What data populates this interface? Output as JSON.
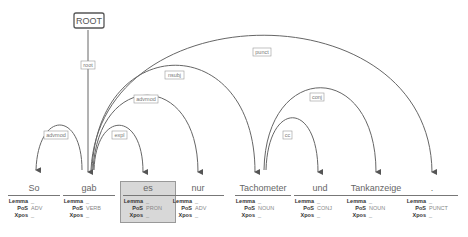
{
  "root_label": "ROOT",
  "tokens": [
    {
      "form": "So",
      "lemma": "_",
      "pos": "ADV",
      "xpos": "_"
    },
    {
      "form": "gab",
      "lemma": "_",
      "pos": "VERB",
      "xpos": "_"
    },
    {
      "form": "es",
      "lemma": "_",
      "pos": "PRON",
      "xpos": "_"
    },
    {
      "form": "nur",
      "lemma": "_",
      "pos": "ADV",
      "xpos": "_"
    },
    {
      "form": "Tachometer",
      "lemma": "_",
      "pos": "NOUN",
      "xpos": "_"
    },
    {
      "form": "und",
      "lemma": "_",
      "pos": "CONJ",
      "xpos": "_"
    },
    {
      "form": "Tankanzeige",
      "lemma": "_",
      "pos": "NOUN",
      "xpos": "_"
    },
    {
      "form": ".",
      "lemma": "_",
      "pos": "PUNCT",
      "xpos": "_"
    }
  ],
  "feature_keys": {
    "lemma": "Lemma",
    "pos": "PoS",
    "xpos": "Xpos"
  },
  "arcs": [
    {
      "label": "root",
      "head": "ROOT",
      "dep": "gab"
    },
    {
      "label": "advmod",
      "head": "gab",
      "dep": "So"
    },
    {
      "label": "expl",
      "head": "gab",
      "dep": "es"
    },
    {
      "label": "advmod",
      "head": "gab",
      "dep": "nur"
    },
    {
      "label": "nsubj",
      "head": "gab",
      "dep": "Tachometer"
    },
    {
      "label": "punct",
      "head": "gab",
      "dep": "."
    },
    {
      "label": "conj",
      "head": "Tachometer",
      "dep": "Tankanzeige"
    },
    {
      "label": "cc",
      "head": "Tachometer",
      "dep": "und"
    }
  ],
  "selected_token": "es"
}
